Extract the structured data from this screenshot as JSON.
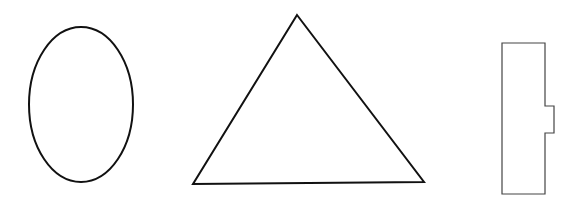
{
  "canvas": {
    "width": 580,
    "height": 208,
    "background": "#ffffff"
  },
  "shapes": [
    {
      "kind": "ellipse",
      "name": "oval",
      "cx": 81,
      "cy": 104.5,
      "rx": 52,
      "ry": 77.5,
      "stroke": "#111111",
      "stroke_width": 2,
      "fill": "none"
    },
    {
      "kind": "polygon",
      "name": "triangle",
      "points": "297,15 424,182 193,184",
      "stroke": "#111111",
      "stroke_width": 2,
      "fill": "none"
    },
    {
      "kind": "path",
      "name": "notched-rectangle",
      "d": "M502,43 H545 V106 H554 V133 H545 V194 H502 Z",
      "stroke": "#444444",
      "stroke_width": 1.2,
      "fill": "none"
    }
  ]
}
